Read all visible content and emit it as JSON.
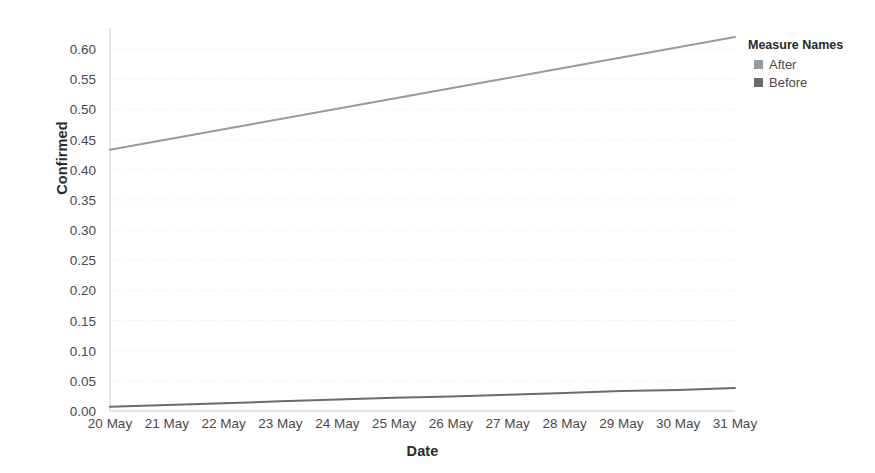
{
  "chart_data": {
    "type": "line",
    "title": "",
    "xlabel": "Date",
    "ylabel": "Confirmed",
    "x": [
      "20 May",
      "21 May",
      "22 May",
      "23 May",
      "24 May",
      "25 May",
      "26 May",
      "27 May",
      "28 May",
      "29 May",
      "30 May",
      "31 May"
    ],
    "categories": [
      "20 May",
      "21 May",
      "22 May",
      "23 May",
      "24 May",
      "25 May",
      "26 May",
      "27 May",
      "28 May",
      "29 May",
      "30 May",
      "31 May"
    ],
    "series": [
      {
        "name": "After",
        "color": "#9a9a9a",
        "values": [
          0.433,
          0.45,
          0.467,
          0.484,
          0.501,
          0.518,
          0.535,
          0.552,
          0.569,
          0.586,
          0.603,
          0.62
        ]
      },
      {
        "name": "Before",
        "color": "#6b6b6b",
        "values": [
          0.007,
          0.01,
          0.013,
          0.016,
          0.019,
          0.022,
          0.024,
          0.027,
          0.03,
          0.033,
          0.035,
          0.038
        ]
      }
    ],
    "ylim": [
      0.0,
      0.635
    ],
    "yticks": [
      0.0,
      0.05,
      0.1,
      0.15,
      0.2,
      0.25,
      0.3,
      0.35,
      0.4,
      0.45,
      0.5,
      0.55,
      0.6
    ],
    "ytick_labels": [
      "0.00",
      "0.05",
      "0.10",
      "0.15",
      "0.20",
      "0.25",
      "0.30",
      "0.35",
      "0.40",
      "0.45",
      "0.50",
      "0.55",
      "0.60"
    ],
    "grid": true,
    "grid_axis": "y",
    "grid_style": "dotted",
    "grid_color": "#e8e8e8",
    "legend_position": "right"
  },
  "legend": {
    "title": "Measure Names",
    "items": [
      {
        "label": "After",
        "color": "#9a9a9a"
      },
      {
        "label": "Before",
        "color": "#6b6b6b"
      }
    ]
  },
  "axes": {
    "y_title": "Confirmed",
    "x_title": "Date",
    "spine_color": "#d4d4d4"
  }
}
